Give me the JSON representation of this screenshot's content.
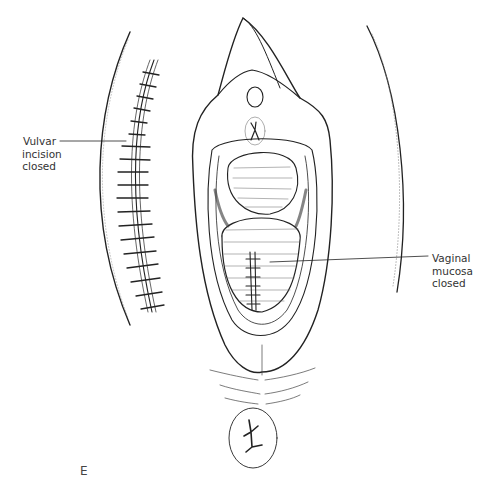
{
  "figure": {
    "panel_letter": "E",
    "labels": {
      "vulvar": [
        "Vulvar",
        "incision",
        "closed"
      ],
      "vaginal": [
        "Vaginal",
        "mucosa",
        "closed"
      ]
    },
    "colors": {
      "ink": "#222222",
      "hatch": "#555555",
      "background": "#ffffff"
    }
  }
}
